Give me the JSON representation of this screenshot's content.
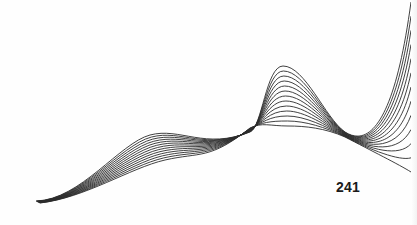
{
  "page": {
    "page_number": "241",
    "background_color": "#fefefe",
    "line_color": "#2b2b2b"
  },
  "artwork": {
    "type": "line-wave-illustration",
    "line_count": 13,
    "description": "Fanned set of sinusoidal strokes converging at the left, crossing at two nodes and spreading out to the right edge"
  }
}
